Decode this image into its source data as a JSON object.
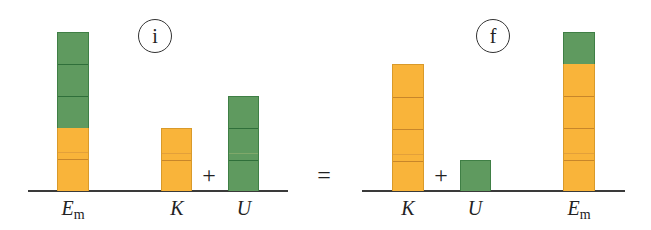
{
  "diagram": {
    "unit_px": 32,
    "colors": {
      "kinetic": "#f9b43a",
      "potential": "#5f9a5f",
      "axis": "#3a3a3a"
    },
    "states": [
      {
        "id": "initial",
        "badge": "i",
        "badge_x": 155,
        "bars": [
          {
            "name": "Em",
            "label_main": "E",
            "label_sub": "m",
            "x": 57,
            "segments": [
              {
                "type": "kinetic",
                "units": 2
              },
              {
                "type": "potential",
                "units": 3
              }
            ]
          },
          {
            "name": "K",
            "label_main": "K",
            "label_sub": "",
            "x": 161,
            "segments": [
              {
                "type": "kinetic",
                "units": 2
              }
            ]
          },
          {
            "name": "U",
            "label_main": "U",
            "label_sub": "",
            "x": 228,
            "segments": [
              {
                "type": "potential",
                "units": 3
              }
            ]
          }
        ],
        "operator": "+"
      },
      {
        "id": "final",
        "badge": "f",
        "badge_x": 493,
        "bars": [
          {
            "name": "K",
            "label_main": "K",
            "label_sub": "",
            "x": 392,
            "segments": [
              {
                "type": "kinetic",
                "units": 4
              }
            ]
          },
          {
            "name": "U",
            "label_main": "U",
            "label_sub": "",
            "x": 460,
            "segments": [
              {
                "type": "potential",
                "units": 1
              }
            ]
          },
          {
            "name": "Em",
            "label_main": "E",
            "label_sub": "m",
            "x": 563,
            "segments": [
              {
                "type": "kinetic",
                "units": 4
              },
              {
                "type": "potential",
                "units": 1
              }
            ]
          }
        ],
        "operator": "+"
      }
    ],
    "equals": "="
  },
  "labels": {
    "badge_initial": "i",
    "badge_final": "f",
    "plus": "+",
    "equals": "=",
    "i_em_main": "E",
    "i_em_sub": "m",
    "i_k": "K",
    "i_u": "U",
    "f_k": "K",
    "f_u": "U",
    "f_em_main": "E",
    "f_em_sub": "m"
  }
}
